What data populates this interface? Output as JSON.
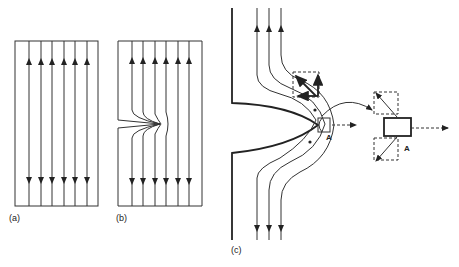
{
  "panels": [
    {
      "id": "a",
      "label": "(a)",
      "description": "Uniform parallel field lines with arrows pointing up and down"
    },
    {
      "id": "b",
      "label": "(b)",
      "description": "Field lines converging toward a notch on the left boundary"
    },
    {
      "id": "c",
      "label": "(c)",
      "description": "Field lines bending around a curved bulge with element A and force decomposition"
    }
  ],
  "annotations": {
    "point_a_label": "A",
    "detail_a_label": "A"
  },
  "colors": {
    "line": "#333333",
    "background": "#ffffff"
  }
}
